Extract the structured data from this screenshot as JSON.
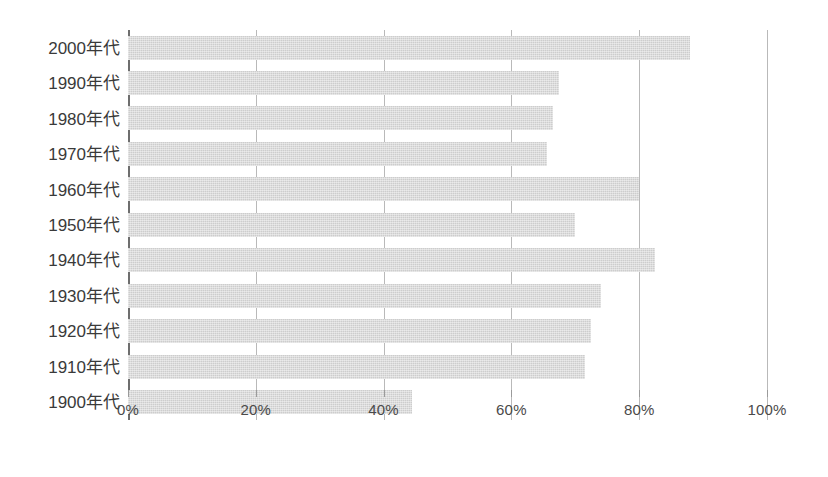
{
  "chart_data": {
    "type": "bar",
    "orientation": "horizontal",
    "title": "",
    "subtitle": "",
    "xlabel": "",
    "ylabel": "",
    "categories": [
      "2000年代",
      "1990年代",
      "1980年代",
      "1970年代",
      "1960年代",
      "1950年代",
      "1940年代",
      "1930年代",
      "1920年代",
      "1910年代",
      "1900年代"
    ],
    "values": [
      88,
      67.5,
      66.5,
      65.5,
      80,
      70,
      82.5,
      74,
      72.5,
      71.5,
      44.5
    ],
    "value_unit": "%",
    "xlim": [
      0,
      100
    ],
    "xticks": [
      0,
      20,
      40,
      60,
      80,
      100
    ],
    "xtick_labels": [
      "0%",
      "20%",
      "40%",
      "60%",
      "80%",
      "100%"
    ],
    "grid": "vertical-only",
    "legend": "none",
    "bar_color": "#cdcdcd",
    "gridline_color": "#b9b9b9",
    "axis_color": "#6e6e6e",
    "label_color": "#3a3a3a",
    "background_color": "#ffffff"
  }
}
